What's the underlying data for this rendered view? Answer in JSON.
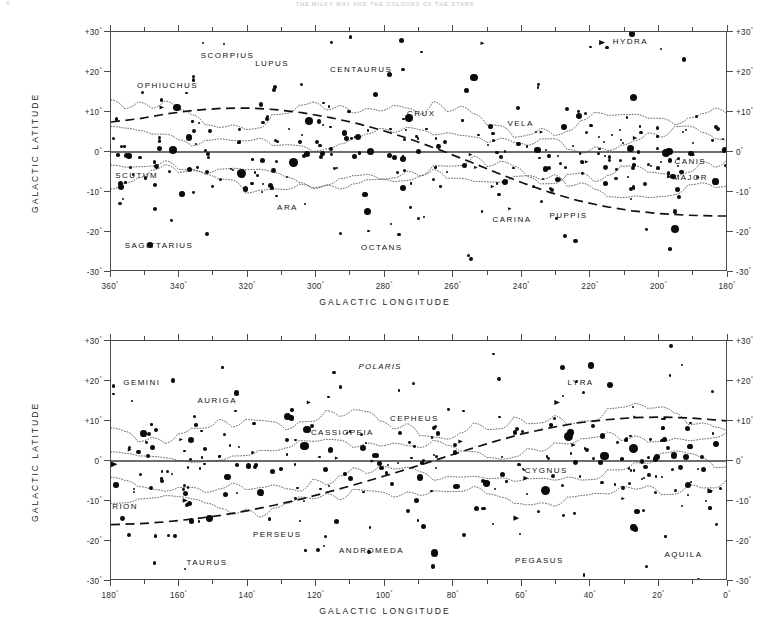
{
  "page": {
    "running_head": "THE MILKY WAY AND THE COLOURS OF THE STARS",
    "folio": "8"
  },
  "axis_titles": {
    "x": "GALACTIC LONGITUDE",
    "y": "GALACTIC LATITUDE"
  },
  "latitude_ticks": [
    "+30",
    "+20",
    "+10",
    "0",
    "-10",
    "-20",
    "-30"
  ],
  "latitude_values": [
    30,
    20,
    10,
    0,
    -10,
    -20,
    -30
  ],
  "degree_symbol": "°",
  "chart_data": [
    {
      "id": "upper-panel",
      "type": "scatter",
      "title": "",
      "xlabel": "GALACTIC LONGITUDE",
      "ylabel": "GALACTIC LATITUDE",
      "xlim": [
        360,
        180
      ],
      "ylim": [
        -30,
        30
      ],
      "x_reversed": true,
      "grid": false,
      "legend": "none",
      "xticks": [
        360,
        340,
        320,
        300,
        280,
        260,
        240,
        220,
        200,
        180
      ],
      "xtick_labels": [
        "360°",
        "340°",
        "320°",
        "300°",
        "280°",
        "260°",
        "240°",
        "220°",
        "200°",
        "180°"
      ],
      "xminor_step": 10,
      "yticks": [
        30,
        20,
        10,
        0,
        -10,
        -20,
        -30
      ],
      "ytick_labels": [
        "+30°",
        "+20°",
        "+10°",
        "0°",
        "-10°",
        "-20°",
        "-30°"
      ],
      "annotations": [
        {
          "text": "OPHIUCHUS",
          "lon": 343.5,
          "lat": 16.5
        },
        {
          "text": "SCORPIUS",
          "lon": 326.0,
          "lat": 24.0
        },
        {
          "text": "LUPUS",
          "lon": 313.0,
          "lat": 22.0
        },
        {
          "text": "CENTAURUS",
          "lon": 287.0,
          "lat": 20.5
        },
        {
          "text": "CRUX",
          "lon": 269.5,
          "lat": 9.5
        },
        {
          "text": "VELA",
          "lon": 240.5,
          "lat": 7.0
        },
        {
          "text": "HYDRA",
          "lon": 208.5,
          "lat": 27.5
        },
        {
          "text": "CANIS",
          "lon": 191.0,
          "lat": -2.5
        },
        {
          "text": "MAJOR",
          "lon": 191.0,
          "lat": -6.5
        },
        {
          "text": "SCUTUM",
          "lon": 352.5,
          "lat": -6.0
        },
        {
          "text": "SAGITTARIUS",
          "lon": 346.0,
          "lat": -23.5
        },
        {
          "text": "ARA",
          "lon": 308.5,
          "lat": -14.0
        },
        {
          "text": "OCTANS",
          "lon": 281.0,
          "lat": -24.0
        },
        {
          "text": "CARINA",
          "lon": 243.0,
          "lat": -17.0
        },
        {
          "text": "PUPPIS",
          "lon": 226.5,
          "lat": -16.0
        }
      ],
      "ecliptic": [
        [
          360,
          7.5
        ],
        [
          352,
          8.3
        ],
        [
          344,
          9.5
        ],
        [
          336,
          10.4
        ],
        [
          328,
          10.9
        ],
        [
          320,
          11.0
        ],
        [
          312,
          10.6
        ],
        [
          304,
          9.8
        ],
        [
          296,
          8.6
        ],
        [
          288,
          7.1
        ],
        [
          280,
          5.2
        ],
        [
          272,
          3.0
        ],
        [
          264,
          0.5
        ],
        [
          256,
          -2.2
        ],
        [
          248,
          -5.0
        ],
        [
          240,
          -7.7
        ],
        [
          232,
          -10.1
        ],
        [
          224,
          -12.1
        ],
        [
          216,
          -13.6
        ],
        [
          208,
          -14.7
        ],
        [
          200,
          -15.4
        ],
        [
          192,
          -15.8
        ],
        [
          184,
          -16.0
        ],
        [
          180,
          -16.0
        ]
      ],
      "star_count": 276
    },
    {
      "id": "lower-panel",
      "type": "scatter",
      "title": "",
      "xlabel": "GALACTIC LONGITUDE",
      "ylabel": "GALACTIC LATITUDE",
      "xlim": [
        180,
        0
      ],
      "ylim": [
        -30,
        30
      ],
      "x_reversed": true,
      "grid": false,
      "legend": "none",
      "xticks": [
        180,
        160,
        140,
        120,
        100,
        80,
        60,
        40,
        20,
        0
      ],
      "xtick_labels": [
        "180°",
        "160°",
        "140°",
        "120°",
        "100°",
        "80°",
        "60°",
        "40°",
        "20°",
        "0°"
      ],
      "xminor_step": 10,
      "yticks": [
        30,
        20,
        10,
        0,
        -10,
        -20,
        -30
      ],
      "ytick_labels": [
        "+30°",
        "+20°",
        "+10°",
        "0°",
        "-10°",
        "-20°",
        "-30°"
      ],
      "annotations": [
        {
          "text": "GEMINI",
          "lon": 171.0,
          "lat": 19.5
        },
        {
          "text": "AURIGA",
          "lon": 149.0,
          "lat": 15.0
        },
        {
          "text": "POLARIS",
          "lon": 101.5,
          "lat": 23.5,
          "style": "italic"
        },
        {
          "text": "CEPHEUS",
          "lon": 91.5,
          "lat": 10.5
        },
        {
          "text": "CASSIOPEIA",
          "lon": 112.5,
          "lat": 7.0
        },
        {
          "text": "LYRA",
          "lon": 43.0,
          "lat": 19.5
        },
        {
          "text": "CYGNUS",
          "lon": 53.0,
          "lat": -2.5
        },
        {
          "text": "ORION",
          "lon": 177.0,
          "lat": -11.5
        },
        {
          "text": "PERSEUS",
          "lon": 131.5,
          "lat": -18.5
        },
        {
          "text": "TAURUS",
          "lon": 152.0,
          "lat": -25.5
        },
        {
          "text": "ANDROMEDA",
          "lon": 104.0,
          "lat": -22.5
        },
        {
          "text": "PEGASUS",
          "lon": 55.0,
          "lat": -25.0
        },
        {
          "text": "AQUILA",
          "lon": 13.0,
          "lat": -23.5
        }
      ],
      "ecliptic": [
        [
          180,
          -15.9
        ],
        [
          172,
          -15.7
        ],
        [
          164,
          -15.2
        ],
        [
          156,
          -14.5
        ],
        [
          148,
          -13.6
        ],
        [
          140,
          -12.4
        ],
        [
          132,
          -11.0
        ],
        [
          124,
          -9.4
        ],
        [
          116,
          -7.6
        ],
        [
          108,
          -5.7
        ],
        [
          100,
          -3.7
        ],
        [
          92,
          -1.6
        ],
        [
          84,
          0.6
        ],
        [
          76,
          2.8
        ],
        [
          68,
          4.9
        ],
        [
          60,
          6.8
        ],
        [
          52,
          8.3
        ],
        [
          44,
          9.5
        ],
        [
          36,
          10.3
        ],
        [
          28,
          10.8
        ],
        [
          20,
          11.0
        ],
        [
          12,
          10.8
        ],
        [
          4,
          10.3
        ],
        [
          0,
          10.0
        ]
      ],
      "star_count": 268
    }
  ]
}
